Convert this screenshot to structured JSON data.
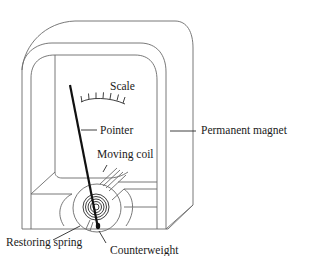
{
  "diagram": {
    "type": "labeled-illustration",
    "labels": {
      "scale": "Scale",
      "pointer": "Pointer",
      "permanent_magnet": "Permanent magnet",
      "moving_coil": "Moving coil",
      "restoring_spring": "Restoring spring",
      "counterweight": "Counterweight"
    },
    "colors": {
      "line": "#6a6a6a",
      "pointer": "#111111",
      "text": "#1a1a1a",
      "background": "#ffffff"
    }
  }
}
